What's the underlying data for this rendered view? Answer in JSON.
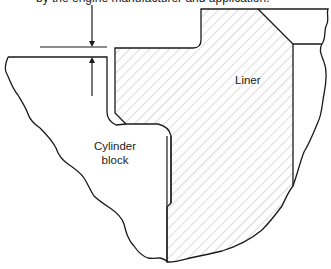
{
  "caption": "by the engine manufacturer and application.",
  "labels": {
    "liner": "Liner",
    "block_line1": "Cylinder",
    "block_line2": "block"
  },
  "annotation": {
    "type": "dimension",
    "meaning": "liner protrusion above cylinder block deck"
  },
  "colors": {
    "line": "#1a1a1a",
    "hatch": "#b8b8b8",
    "background": "#ffffff"
  }
}
